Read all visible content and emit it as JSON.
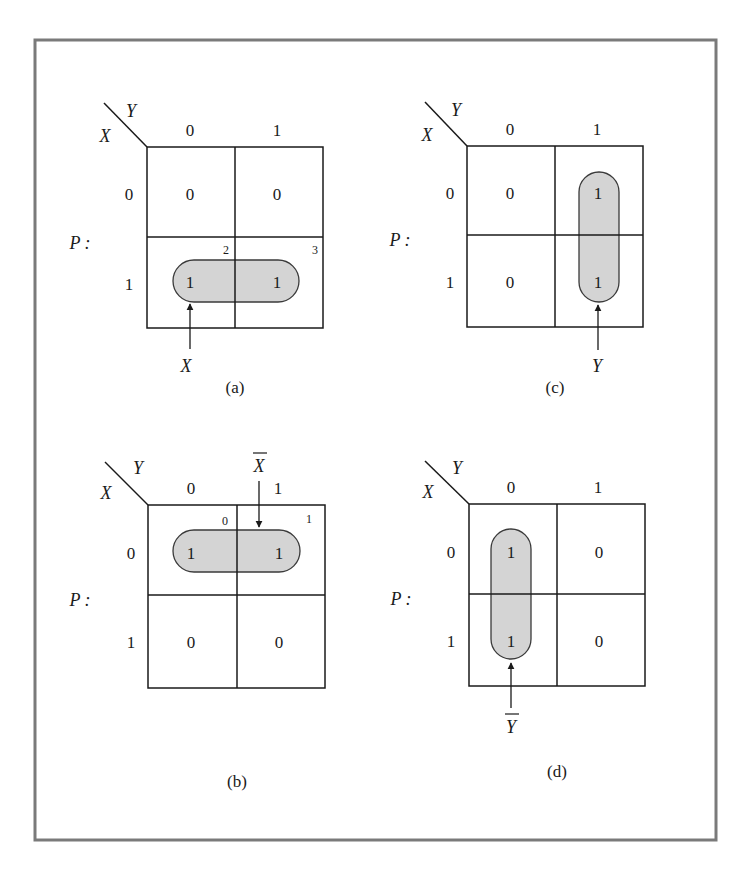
{
  "figure": {
    "frame_color": "#7a7a7a",
    "line_color": "#1a1a1a",
    "loop_fill": "#d4d4d4",
    "loop_stroke": "#3a3a3a",
    "kmaps": [
      {
        "id": "a",
        "caption": "(a)",
        "row_var": "X",
        "col_var": "Y",
        "function_label": "P :",
        "col_headers": [
          "0",
          "1"
        ],
        "row_headers": [
          "0",
          "1"
        ],
        "cells": [
          [
            "0",
            "0"
          ],
          [
            "1",
            "1"
          ]
        ],
        "cell_indices": {
          "r1c0": "2",
          "r1c1": "3"
        },
        "grouping": "row 1 (horizontal)",
        "term_label": "X",
        "term_overbar": false,
        "arrow": "up"
      },
      {
        "id": "c",
        "caption": "(c)",
        "row_var": "X",
        "col_var": "Y",
        "function_label": "P :",
        "col_headers": [
          "0",
          "1"
        ],
        "row_headers": [
          "0",
          "1"
        ],
        "cells": [
          [
            "0",
            "1"
          ],
          [
            "0",
            "1"
          ]
        ],
        "grouping": "column 1 (vertical)",
        "term_label": "Y",
        "term_overbar": false,
        "arrow": "up"
      },
      {
        "id": "b",
        "caption": "(b)",
        "row_var": "X",
        "col_var": "Y",
        "function_label": "P :",
        "col_headers": [
          "0",
          "1"
        ],
        "row_headers": [
          "0",
          "1"
        ],
        "cells": [
          [
            "1",
            "1"
          ],
          [
            "0",
            "0"
          ]
        ],
        "cell_indices": {
          "r0c0": "0",
          "r0c1": "1"
        },
        "grouping": "row 0 (horizontal)",
        "term_label": "X",
        "term_overbar": true,
        "arrow": "down"
      },
      {
        "id": "d",
        "caption": "(d)",
        "row_var": "X",
        "col_var": "Y",
        "function_label": "P :",
        "col_headers": [
          "0",
          "1"
        ],
        "row_headers": [
          "0",
          "1"
        ],
        "cells": [
          [
            "1",
            "0"
          ],
          [
            "1",
            "0"
          ]
        ],
        "grouping": "column 0 (vertical)",
        "term_label": "Y",
        "term_overbar": true,
        "arrow": "up"
      }
    ]
  }
}
